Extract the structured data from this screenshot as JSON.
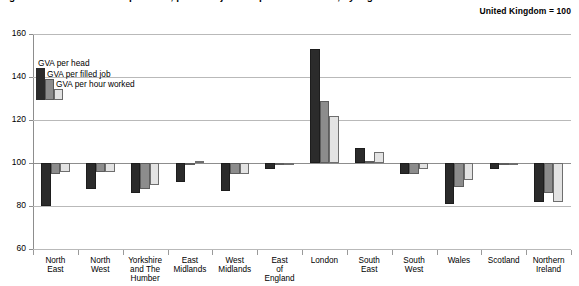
{
  "header": {
    "title_cutoff": "Figure: Gross value added per head, per filled job and per hour worked, by region",
    "index_note": "United Kingdom = 100"
  },
  "legend": {
    "items": [
      {
        "label": "GVA per head",
        "color": "#2b2b2b",
        "key": "per_head"
      },
      {
        "label": "GVA per filled job",
        "color": "#8c8c8c",
        "key": "per_filled_job"
      },
      {
        "label": "GVA per hour worked",
        "color": "#e3e3e3",
        "key": "per_hour_worked"
      }
    ]
  },
  "chart_data": {
    "type": "bar",
    "title": "",
    "subtitle": "United Kingdom = 100",
    "xlabel": "",
    "ylabel": "",
    "ylim": [
      60,
      160
    ],
    "yticks": [
      60,
      80,
      100,
      120,
      140,
      160
    ],
    "grid": true,
    "baseline": 100,
    "legend_position": "inside-top-left",
    "categories": [
      "North East",
      "North West",
      "Yorkshire and The Humber",
      "East Midlands",
      "West Midlands",
      "East of England",
      "London",
      "South East",
      "South West",
      "Wales",
      "Scotland",
      "Northern Ireland"
    ],
    "category_lines": [
      [
        "North",
        "East"
      ],
      [
        "North",
        "West"
      ],
      [
        "Yorkshire",
        "and The",
        "Humber"
      ],
      [
        "East",
        "Midlands"
      ],
      [
        "West",
        "Midlands"
      ],
      [
        "East",
        "of",
        "England"
      ],
      [
        "London"
      ],
      [
        "South",
        "East"
      ],
      [
        "South",
        "West"
      ],
      [
        "Wales"
      ],
      [
        "Scotland"
      ],
      [
        "Northern",
        "Ireland"
      ]
    ],
    "series": [
      {
        "name": "GVA per head",
        "color": "#2b2b2b",
        "values": [
          80,
          88,
          86,
          91,
          87,
          97,
          153,
          107,
          95,
          81,
          97,
          82
        ]
      },
      {
        "name": "GVA per filled job",
        "color": "#8c8c8c",
        "values": [
          95,
          96,
          88,
          100,
          95,
          100,
          129,
          101,
          95,
          89,
          99,
          86
        ]
      },
      {
        "name": "GVA per hour worked",
        "color": "#e3e3e3",
        "values": [
          96,
          96,
          90,
          101,
          95,
          100,
          122,
          105,
          97,
          92,
          100,
          82
        ]
      }
    ]
  }
}
